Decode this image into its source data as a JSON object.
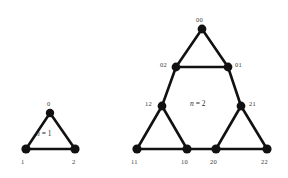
{
  "figure": {
    "background_color": "#ffffff",
    "ink_color": "#111111",
    "label_color": "#3a3a3a"
  },
  "chart_data": {
    "type": "diagram",
    "xlabel": "",
    "ylabel": "",
    "graphs": [
      {
        "name": "n1",
        "order_label_prefix": "n",
        "order_label_equals": "=",
        "order_label_value": "1",
        "order_label_x": 36,
        "order_label_y": 130,
        "nodes": [
          {
            "id": "0",
            "label": "0",
            "x": 50,
            "y": 113,
            "r": 4.2,
            "label_x": 47,
            "label_y": 101
          },
          {
            "id": "1",
            "label": "1",
            "x": 26,
            "y": 149,
            "r": 4.6,
            "label_x": 21,
            "label_y": 159
          },
          {
            "id": "2",
            "label": "2",
            "x": 75,
            "y": 149,
            "r": 4.6,
            "label_x": 72,
            "label_y": 159
          }
        ],
        "edges": [
          {
            "from": "0",
            "to": "1"
          },
          {
            "from": "0",
            "to": "2"
          },
          {
            "from": "1",
            "to": "2"
          }
        ]
      },
      {
        "name": "n2",
        "order_label_prefix": "n",
        "order_label_equals": "=",
        "order_label_value": "2",
        "order_label_x": 190,
        "order_label_y": 100,
        "nodes": [
          {
            "id": "00",
            "label": "00",
            "x": 202,
            "y": 29,
            "r": 4.4,
            "label_x": 196,
            "label_y": 17
          },
          {
            "id": "02",
            "label": "02",
            "x": 176,
            "y": 67,
            "r": 4.4,
            "label_x": 160,
            "label_y": 62
          },
          {
            "id": "01",
            "label": "01",
            "x": 228,
            "y": 67,
            "r": 4.4,
            "label_x": 235,
            "label_y": 62
          },
          {
            "id": "12",
            "label": "12",
            "x": 162,
            "y": 106,
            "r": 4.4,
            "label_x": 145,
            "label_y": 101
          },
          {
            "id": "21",
            "label": "21",
            "x": 241,
            "y": 106,
            "r": 4.4,
            "label_x": 249,
            "label_y": 101
          },
          {
            "id": "11",
            "label": "11",
            "x": 137,
            "y": 149,
            "r": 4.6,
            "label_x": 131,
            "label_y": 159
          },
          {
            "id": "10",
            "label": "10",
            "x": 187,
            "y": 149,
            "r": 4.6,
            "label_x": 181,
            "label_y": 159
          },
          {
            "id": "20",
            "label": "20",
            "x": 216,
            "y": 149,
            "r": 4.6,
            "label_x": 210,
            "label_y": 159
          },
          {
            "id": "22",
            "label": "22",
            "x": 267,
            "y": 149,
            "r": 4.6,
            "label_x": 261,
            "label_y": 159
          }
        ],
        "edges": [
          {
            "from": "00",
            "to": "02"
          },
          {
            "from": "00",
            "to": "01"
          },
          {
            "from": "02",
            "to": "01"
          },
          {
            "from": "02",
            "to": "12"
          },
          {
            "from": "01",
            "to": "21"
          },
          {
            "from": "12",
            "to": "11"
          },
          {
            "from": "12",
            "to": "10"
          },
          {
            "from": "11",
            "to": "10"
          },
          {
            "from": "10",
            "to": "20"
          },
          {
            "from": "21",
            "to": "20"
          },
          {
            "from": "21",
            "to": "22"
          },
          {
            "from": "20",
            "to": "22"
          }
        ]
      }
    ]
  }
}
